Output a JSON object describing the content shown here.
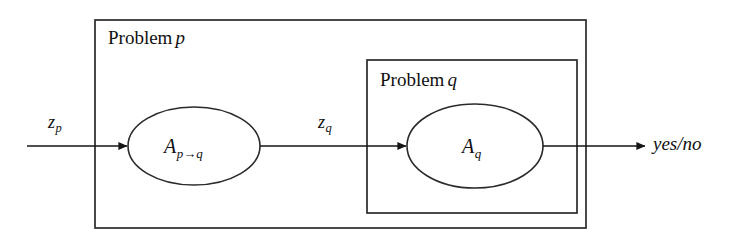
{
  "figure": {
    "type": "flow-diagram",
    "background_color": "#ffffff",
    "stroke_color": "#1a1a1a",
    "boxes": [
      {
        "id": "problem-p",
        "title_text": "Problem",
        "title_var": "p",
        "x": 95,
        "y": 20,
        "width": 491,
        "height": 208
      },
      {
        "id": "problem-q",
        "title_text": "Problem",
        "title_var": "q",
        "x": 367,
        "y": 60,
        "width": 210,
        "height": 153
      }
    ],
    "nodes": [
      {
        "id": "node-apq",
        "base": "A",
        "subscript": "p→q",
        "cx": 194,
        "cy": 146,
        "rx": 66,
        "ry": 39
      },
      {
        "id": "node-aq",
        "base": "A",
        "subscript": "q",
        "cx": 475,
        "cy": 146,
        "rx": 68,
        "ry": 42
      }
    ],
    "edges": [
      {
        "id": "edge-input",
        "base": "z",
        "subscript": "p",
        "label_x": 48,
        "label_y": 113,
        "x1": 27,
        "x2": 127,
        "y": 146
      },
      {
        "id": "edge-middle",
        "base": "z",
        "subscript": "q",
        "label_x": 318,
        "label_y": 113,
        "x1": 260,
        "x2": 406,
        "y": 146
      },
      {
        "id": "edge-output",
        "x1": 543,
        "x2": 645,
        "y": 146
      }
    ],
    "output": {
      "id": "output-label",
      "text": "yes/no",
      "x": 653,
      "y": 134
    }
  }
}
